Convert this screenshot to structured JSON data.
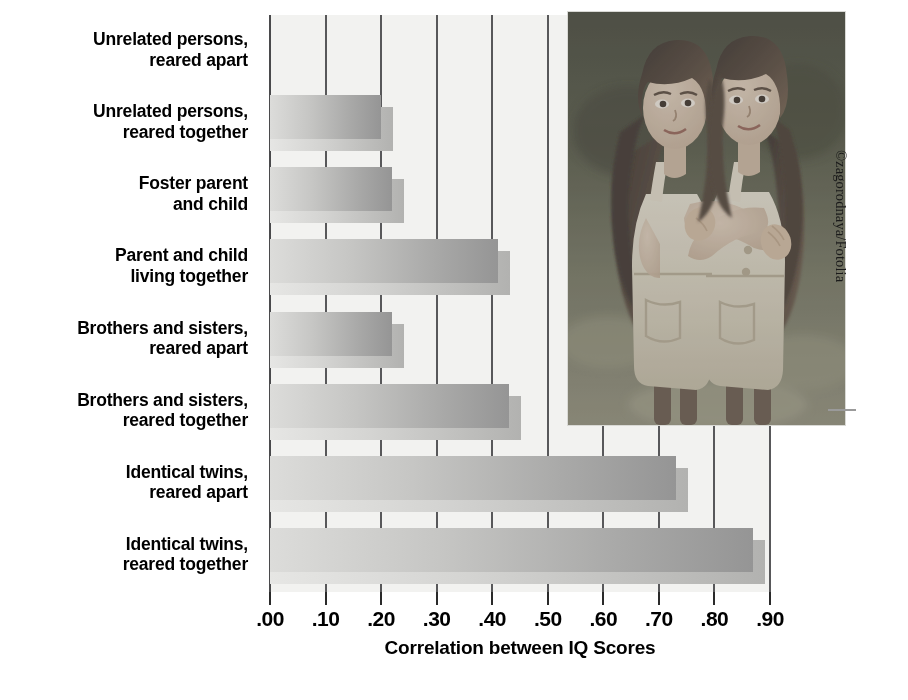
{
  "chart_data": {
    "type": "bar",
    "orientation": "horizontal",
    "title": "",
    "xlabel": "Correlation between IQ Scores",
    "ylabel": "",
    "xlim": [
      0.0,
      0.9
    ],
    "grid": true,
    "legend": null,
    "categories": [
      "Unrelated persons, reared apart",
      "Unrelated persons, reared together",
      "Foster parent and child",
      "Parent and child living together",
      "Brothers and sisters, reared apart",
      "Brothers and sisters, reared together",
      "Identical twins, reared apart",
      "Identical twins, reared together"
    ],
    "values": [
      0.0,
      0.2,
      0.22,
      0.41,
      0.22,
      0.43,
      0.73,
      0.87
    ],
    "xticks": [
      0.0,
      0.1,
      0.2,
      0.3,
      0.4,
      0.5,
      0.6,
      0.7,
      0.8,
      0.9
    ],
    "xticklabels": [
      ".00",
      ".10",
      ".20",
      ".30",
      ".40",
      ".50",
      ".60",
      ".70",
      ".80",
      ".90"
    ]
  },
  "labels": [
    {
      "line1": "Unrelated persons,",
      "line2": "reared apart"
    },
    {
      "line1": "Unrelated persons,",
      "line2": "reared together"
    },
    {
      "line1": "Foster parent",
      "line2": "and child"
    },
    {
      "line1": "Parent and child",
      "line2": "living together"
    },
    {
      "line1": "Brothers and sisters,",
      "line2": "reared apart"
    },
    {
      "line1": "Brothers and sisters,",
      "line2": "reared together"
    },
    {
      "line1": "Identical twins,",
      "line2": "reared apart"
    },
    {
      "line1": "Identical twins,",
      "line2": "reared together"
    }
  ],
  "axis": {
    "title": "Correlation between IQ Scores"
  },
  "photo": {
    "alt": "Two identical twin girls with long dark curly hair embracing, wearing light denim overall dresses, outdoors on grass",
    "credit": "©zagorodnaya/Fotolia"
  },
  "colors": {
    "bar_light": "#dcdcda",
    "bar_dark": "#959595",
    "bar_shadow_light": "#e6e6e4",
    "bar_shadow_dark": "#b2b2b0",
    "plot_background": "#f2f2f0",
    "gridline": "#58585a",
    "text": "#000000"
  }
}
